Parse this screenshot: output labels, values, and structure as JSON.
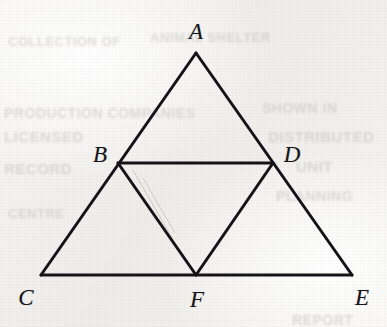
{
  "figure": {
    "background_color": "#f3f2f0",
    "stroke_color": "#141418",
    "stroke_width": 3,
    "canvas": {
      "width": 387,
      "height": 327
    },
    "vertices": [
      {
        "id": "A",
        "label": "A",
        "x": 196,
        "y": 53,
        "label_x": 196,
        "label_y": 31,
        "role": "apex"
      },
      {
        "id": "B",
        "label": "B",
        "x": 118,
        "y": 163,
        "label_x": 100,
        "label_y": 154,
        "role": "midpoint-AC"
      },
      {
        "id": "D",
        "label": "D",
        "x": 273,
        "y": 163,
        "label_x": 292,
        "label_y": 154,
        "role": "midpoint-AE"
      },
      {
        "id": "C",
        "label": "C",
        "x": 41,
        "y": 275,
        "label_x": 26,
        "label_y": 297,
        "role": "base-left"
      },
      {
        "id": "F",
        "label": "F",
        "x": 196,
        "y": 275,
        "label_x": 197,
        "label_y": 299,
        "role": "midpoint-CE"
      },
      {
        "id": "E",
        "label": "E",
        "x": 352,
        "y": 275,
        "label_x": 362,
        "label_y": 297,
        "role": "base-right"
      }
    ],
    "segments": [
      {
        "id": "AC",
        "from": "A",
        "to": "C",
        "kind": "outer-side"
      },
      {
        "id": "AE",
        "from": "A",
        "to": "E",
        "kind": "outer-side"
      },
      {
        "id": "CE",
        "from": "C",
        "to": "E",
        "kind": "outer-base"
      },
      {
        "id": "BD",
        "from": "B",
        "to": "D",
        "kind": "midsegment"
      },
      {
        "id": "BF",
        "from": "B",
        "to": "F",
        "kind": "midsegment"
      },
      {
        "id": "DF",
        "from": "D",
        "to": "F",
        "kind": "midsegment"
      }
    ],
    "pencil_marks": [
      {
        "id": "stray-1",
        "x1": 133,
        "y1": 170,
        "x2": 172,
        "y2": 238
      },
      {
        "id": "stray-2",
        "x1": 143,
        "y1": 178,
        "x2": 175,
        "y2": 233
      }
    ]
  },
  "ghost_text": [
    {
      "id": "ghost-row-1",
      "text": "COLLECTION OF",
      "x": 8,
      "y": 34,
      "size": 13
    },
    {
      "id": "ghost-row-2",
      "text": "ANIMAL SHELTER",
      "x": 150,
      "y": 30,
      "size": 13
    },
    {
      "id": "ghost-row-3",
      "text": "PRODUCTION COMPANIES",
      "x": 4,
      "y": 105,
      "size": 14
    },
    {
      "id": "ghost-row-4",
      "text": "SHOWN IN",
      "x": 262,
      "y": 100,
      "size": 14
    },
    {
      "id": "ghost-row-5",
      "text": "LICENSED",
      "x": 4,
      "y": 128,
      "size": 15
    },
    {
      "id": "ghost-row-6",
      "text": "DISTRIBUTED",
      "x": 268,
      "y": 128,
      "size": 15
    },
    {
      "id": "ghost-row-7",
      "text": "RECORD",
      "x": 4,
      "y": 160,
      "size": 15
    },
    {
      "id": "ghost-row-8",
      "text": "UNIT",
      "x": 296,
      "y": 158,
      "size": 15
    },
    {
      "id": "ghost-row-9",
      "text": "PLANNING",
      "x": 276,
      "y": 188,
      "size": 14
    },
    {
      "id": "ghost-row-10",
      "text": "CENTRE",
      "x": 8,
      "y": 206,
      "size": 13
    },
    {
      "id": "ghost-row-11",
      "text": "REPORT",
      "x": 292,
      "y": 312,
      "size": 14
    }
  ]
}
